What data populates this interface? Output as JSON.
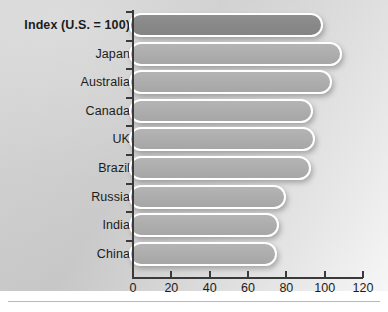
{
  "chart_data": {
    "type": "bar",
    "orientation": "horizontal",
    "title": "",
    "subtitle": "",
    "xlabel": "",
    "ylabel": "",
    "axis_note": "Index (U.S. = 100)",
    "categories": [
      "Index (U.S. = 100)",
      "Japan",
      "Australia",
      "Canada",
      "UK",
      "Brazil",
      "Russia",
      "India",
      "China"
    ],
    "values": [
      98,
      108,
      103,
      93,
      94,
      92,
      79,
      75,
      74
    ],
    "highlight_index": 0,
    "xlim": [
      0,
      120
    ],
    "xticks": [
      0,
      20,
      40,
      60,
      80,
      100,
      120
    ],
    "xtick_labels": [
      "0",
      "20",
      "40",
      "60",
      "80",
      "100",
      "120"
    ],
    "grid": false,
    "legend": null,
    "colors": {
      "bar_fill": "#aeaeae",
      "bar_fill_highlight": "#898989",
      "bar_outline": "#ffffff",
      "axis": "#3a3a3a",
      "text": "#1c1c1c",
      "background": "#cfcfcf"
    }
  }
}
